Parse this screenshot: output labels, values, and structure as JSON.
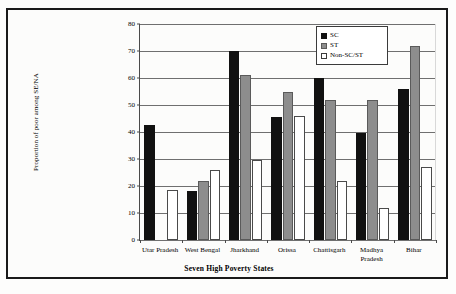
{
  "chart_data": {
    "type": "bar",
    "title": "",
    "xlabel": "Seven High Poverty States",
    "ylabel": "Proportion of poor among SE/NA",
    "ylim": [
      0,
      80
    ],
    "ytick_step": 10,
    "yticks": [
      0,
      10,
      20,
      30,
      40,
      50,
      60,
      70,
      80
    ],
    "grid": true,
    "legend_position": "top-right",
    "categories": [
      "Utar Pradesh",
      "West Bengal",
      "Jharkhand",
      "Orissa",
      "Chattisgarh",
      "Madhya\nPradesh",
      "Bihar"
    ],
    "series": [
      {
        "name": "SC",
        "color": "#111111",
        "values": [
          42.5,
          18.0,
          70.0,
          45.5,
          60.0,
          39.5,
          56.0
        ]
      },
      {
        "name": "ST",
        "color": "#8d8d8d",
        "values": [
          0,
          22.0,
          61.0,
          55.0,
          52.0,
          52.0,
          72.0
        ]
      },
      {
        "name": "Non-SC/ST",
        "color": "#ffffff",
        "values": [
          18.5,
          26.0,
          29.5,
          46.0,
          22.0,
          12.0,
          27.0
        ]
      }
    ]
  },
  "legend": {
    "items": [
      {
        "label": "SC"
      },
      {
        "label": "ST"
      },
      {
        "label": "Non-SC/ST"
      }
    ]
  },
  "axis": {
    "y_title": "Proportion of poor among SE/NA",
    "x_title": "Seven High Poverty States"
  }
}
